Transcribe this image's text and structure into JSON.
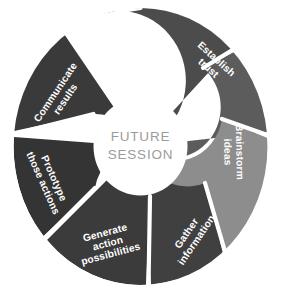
{
  "diagram": {
    "type": "iris-cycle",
    "title_center_line1": "FUTURE",
    "title_center_line2": "SESSION",
    "center_text_color": "#9b9b9b",
    "background_color": "#ffffff",
    "gap_color": "#ffffff",
    "label_color": "#ffffff",
    "blade_count": 7,
    "blades": [
      {
        "id": "build-relationships",
        "label_lines": [
          "Build",
          "relationships"
        ],
        "color": "#4c4c4c",
        "order": 1
      },
      {
        "id": "establish-trust",
        "label_lines": [
          "Establish",
          "trust"
        ],
        "color": "#5c5c5c",
        "order": 2
      },
      {
        "id": "brainstorm-ideas",
        "label_lines": [
          "Brainstorm",
          "ideas"
        ],
        "color": "#8d8d8d",
        "order": 3
      },
      {
        "id": "gather-information",
        "label_lines": [
          "Gather",
          "information"
        ],
        "color": "#404040",
        "order": 4
      },
      {
        "id": "generate-action-possibilities",
        "label_lines": [
          "Generate",
          "action",
          "possibilities"
        ],
        "color": "#3b3b3b",
        "order": 5
      },
      {
        "id": "prototype-those-actions",
        "label_lines": [
          "Prototype",
          "those actions"
        ],
        "color": "#343434",
        "order": 6
      },
      {
        "id": "communicate-results",
        "label_lines": [
          "Communicate",
          "results"
        ],
        "color": "#3a3a3a",
        "order": 7
      }
    ]
  }
}
